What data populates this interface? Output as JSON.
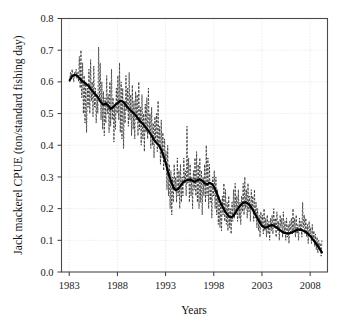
{
  "chart_data": {
    "type": "line",
    "title": "",
    "xlabel": "Years",
    "ylabel": "Jack mackerel CPUE (ton/standard fishing day)",
    "xlim": [
      1982.2,
      2009.8
    ],
    "ylim": [
      0.0,
      0.8
    ],
    "grid": true,
    "legend": "none",
    "xticks": [
      1983,
      1988,
      1993,
      1998,
      2003,
      2008
    ],
    "xtick_labels": [
      "1983",
      "1988",
      "1993",
      "1998",
      "2003",
      "2008"
    ],
    "yticks": [
      0.0,
      0.1,
      0.2,
      0.3,
      0.4,
      0.5,
      0.6,
      0.7,
      0.8
    ],
    "ytick_labels": [
      "0.0",
      "0.1",
      "0.2",
      "0.3",
      "0.4",
      "0.5",
      "0.6",
      "0.7",
      "0.8"
    ],
    "series": [
      {
        "name": "Monthly CPUE",
        "style": "dashed-thin",
        "color": "#262626",
        "x": [
          1983.05,
          1983.14,
          1983.22,
          1983.3,
          1983.39,
          1983.47,
          1983.55,
          1983.64,
          1983.72,
          1983.8,
          1983.89,
          1983.97,
          1984.05,
          1984.14,
          1984.22,
          1984.3,
          1984.39,
          1984.47,
          1984.55,
          1984.64,
          1984.72,
          1984.8,
          1984.89,
          1984.97,
          1985.05,
          1985.14,
          1985.22,
          1985.3,
          1985.39,
          1985.47,
          1985.55,
          1985.64,
          1985.72,
          1985.8,
          1985.89,
          1985.97,
          1986.05,
          1986.14,
          1986.22,
          1986.3,
          1986.39,
          1986.47,
          1986.55,
          1986.64,
          1986.72,
          1986.8,
          1986.89,
          1986.97,
          1987.05,
          1987.14,
          1987.22,
          1987.3,
          1987.39,
          1987.47,
          1987.55,
          1987.64,
          1987.72,
          1987.8,
          1987.89,
          1987.97,
          1988.05,
          1988.14,
          1988.22,
          1988.3,
          1988.39,
          1988.47,
          1988.55,
          1988.64,
          1988.72,
          1988.8,
          1988.89,
          1988.97,
          1989.05,
          1989.14,
          1989.22,
          1989.3,
          1989.39,
          1989.47,
          1989.55,
          1989.64,
          1989.72,
          1989.8,
          1989.89,
          1989.97,
          1990.05,
          1990.14,
          1990.22,
          1990.3,
          1990.39,
          1990.47,
          1990.55,
          1990.64,
          1990.72,
          1990.8,
          1990.89,
          1990.97,
          1991.05,
          1991.14,
          1991.22,
          1991.3,
          1991.39,
          1991.47,
          1991.55,
          1991.64,
          1991.72,
          1991.8,
          1991.89,
          1991.97,
          1992.05,
          1992.14,
          1992.22,
          1992.3,
          1992.39,
          1992.47,
          1992.55,
          1992.64,
          1992.72,
          1992.8,
          1992.89,
          1992.97,
          1993.05,
          1993.14,
          1993.22,
          1993.3,
          1993.39,
          1993.47,
          1993.55,
          1993.64,
          1993.72,
          1993.8,
          1993.89,
          1993.97,
          1994.05,
          1994.14,
          1994.22,
          1994.3,
          1994.39,
          1994.47,
          1994.55,
          1994.64,
          1994.72,
          1994.8,
          1994.89,
          1994.97,
          1995.05,
          1995.14,
          1995.22,
          1995.3,
          1995.39,
          1995.47,
          1995.55,
          1995.64,
          1995.72,
          1995.8,
          1995.89,
          1995.97,
          1996.05,
          1996.14,
          1996.22,
          1996.3,
          1996.39,
          1996.47,
          1996.55,
          1996.64,
          1996.72,
          1996.8,
          1996.89,
          1996.97,
          1997.05,
          1997.14,
          1997.22,
          1997.3,
          1997.39,
          1997.47,
          1997.55,
          1997.64,
          1997.72,
          1997.8,
          1997.89,
          1997.97,
          1998.05,
          1998.14,
          1998.22,
          1998.3,
          1998.39,
          1998.47,
          1998.55,
          1998.64,
          1998.72,
          1998.8,
          1998.89,
          1998.97,
          1999.05,
          1999.14,
          1999.22,
          1999.3,
          1999.39,
          1999.47,
          1999.55,
          1999.64,
          1999.72,
          1999.8,
          1999.89,
          1999.97,
          2000.05,
          2000.14,
          2000.22,
          2000.3,
          2000.39,
          2000.47,
          2000.55,
          2000.64,
          2000.72,
          2000.8,
          2000.89,
          2000.97,
          2001.05,
          2001.14,
          2001.22,
          2001.3,
          2001.39,
          2001.47,
          2001.55,
          2001.64,
          2001.72,
          2001.8,
          2001.89,
          2001.97,
          2002.05,
          2002.14,
          2002.22,
          2002.3,
          2002.39,
          2002.47,
          2002.55,
          2002.64,
          2002.72,
          2002.8,
          2002.89,
          2002.97,
          2003.05,
          2003.14,
          2003.22,
          2003.3,
          2003.39,
          2003.47,
          2003.55,
          2003.64,
          2003.72,
          2003.8,
          2003.89,
          2003.97,
          2004.05,
          2004.14,
          2004.22,
          2004.3,
          2004.39,
          2004.47,
          2004.55,
          2004.64,
          2004.72,
          2004.8,
          2004.89,
          2004.97,
          2005.05,
          2005.14,
          2005.22,
          2005.3,
          2005.39,
          2005.47,
          2005.55,
          2005.64,
          2005.72,
          2005.8,
          2005.89,
          2005.97,
          2006.05,
          2006.14,
          2006.22,
          2006.3,
          2006.39,
          2006.47,
          2006.55,
          2006.64,
          2006.72,
          2006.8,
          2006.89,
          2006.97,
          2007.05,
          2007.14,
          2007.22,
          2007.3,
          2007.39,
          2007.47,
          2007.55,
          2007.64,
          2007.72,
          2007.8,
          2007.89,
          2007.97,
          2008.05,
          2008.14,
          2008.22,
          2008.3,
          2008.39,
          2008.47,
          2008.55,
          2008.64,
          2008.72,
          2008.8,
          2008.89,
          2008.97,
          2009.05,
          2009.14,
          2009.22
        ],
        "y": [
          0.6,
          0.63,
          0.61,
          0.64,
          0.62,
          0.6,
          0.63,
          0.62,
          0.64,
          0.61,
          0.63,
          0.6,
          0.68,
          0.58,
          0.7,
          0.55,
          0.66,
          0.5,
          0.62,
          0.47,
          0.6,
          0.44,
          0.58,
          0.52,
          0.64,
          0.5,
          0.67,
          0.54,
          0.6,
          0.49,
          0.65,
          0.52,
          0.58,
          0.47,
          0.56,
          0.5,
          0.71,
          0.55,
          0.66,
          0.48,
          0.6,
          0.45,
          0.57,
          0.43,
          0.55,
          0.47,
          0.62,
          0.5,
          0.56,
          0.44,
          0.6,
          0.46,
          0.64,
          0.48,
          0.55,
          0.41,
          0.52,
          0.45,
          0.58,
          0.5,
          0.62,
          0.48,
          0.66,
          0.44,
          0.6,
          0.42,
          0.58,
          0.39,
          0.54,
          0.47,
          0.62,
          0.51,
          0.58,
          0.46,
          0.63,
          0.48,
          0.56,
          0.43,
          0.59,
          0.45,
          0.54,
          0.42,
          0.57,
          0.48,
          0.56,
          0.43,
          0.6,
          0.45,
          0.52,
          0.4,
          0.56,
          0.42,
          0.5,
          0.38,
          0.53,
          0.44,
          0.55,
          0.42,
          0.58,
          0.44,
          0.5,
          0.39,
          0.52,
          0.4,
          0.47,
          0.36,
          0.49,
          0.42,
          0.5,
          0.38,
          0.54,
          0.4,
          0.46,
          0.34,
          0.48,
          0.36,
          0.44,
          0.32,
          0.42,
          0.35,
          0.38,
          0.26,
          0.4,
          0.24,
          0.34,
          0.2,
          0.32,
          0.18,
          0.3,
          0.22,
          0.34,
          0.26,
          0.3,
          0.22,
          0.36,
          0.24,
          0.32,
          0.2,
          0.34,
          0.22,
          0.3,
          0.24,
          0.36,
          0.28,
          0.32,
          0.24,
          0.46,
          0.28,
          0.36,
          0.22,
          0.34,
          0.24,
          0.3,
          0.2,
          0.32,
          0.26,
          0.36,
          0.24,
          0.38,
          0.22,
          0.34,
          0.2,
          0.36,
          0.22,
          0.32,
          0.18,
          0.3,
          0.24,
          0.34,
          0.22,
          0.4,
          0.24,
          0.36,
          0.2,
          0.34,
          0.22,
          0.28,
          0.17,
          0.3,
          0.24,
          0.32,
          0.2,
          0.3,
          0.18,
          0.26,
          0.15,
          0.24,
          0.14,
          0.22,
          0.13,
          0.24,
          0.18,
          0.28,
          0.16,
          0.26,
          0.15,
          0.22,
          0.13,
          0.24,
          0.14,
          0.2,
          0.12,
          0.22,
          0.16,
          0.26,
          0.17,
          0.28,
          0.18,
          0.24,
          0.16,
          0.26,
          0.17,
          0.22,
          0.15,
          0.24,
          0.19,
          0.28,
          0.18,
          0.3,
          0.2,
          0.26,
          0.17,
          0.28,
          0.19,
          0.24,
          0.16,
          0.26,
          0.2,
          0.24,
          0.16,
          0.26,
          0.17,
          0.22,
          0.14,
          0.2,
          0.13,
          0.18,
          0.11,
          0.19,
          0.14,
          0.18,
          0.12,
          0.2,
          0.13,
          0.17,
          0.11,
          0.18,
          0.12,
          0.16,
          0.1,
          0.17,
          0.13,
          0.18,
          0.12,
          0.2,
          0.14,
          0.17,
          0.11,
          0.19,
          0.13,
          0.16,
          0.1,
          0.18,
          0.14,
          0.17,
          0.11,
          0.19,
          0.12,
          0.16,
          0.1,
          0.17,
          0.11,
          0.15,
          0.09,
          0.16,
          0.12,
          0.17,
          0.12,
          0.2,
          0.13,
          0.17,
          0.11,
          0.18,
          0.12,
          0.15,
          0.1,
          0.17,
          0.13,
          0.16,
          0.11,
          0.22,
          0.14,
          0.18,
          0.12,
          0.17,
          0.11,
          0.15,
          0.09,
          0.16,
          0.12,
          0.14,
          0.09,
          0.15,
          0.1,
          0.13,
          0.08,
          0.12,
          0.07,
          0.11,
          0.06,
          0.1,
          0.08,
          0.09,
          0.05,
          0.1
        ]
      },
      {
        "name": "Smoothed CPUE (moving average)",
        "style": "solid-bold",
        "color": "#000000",
        "x": [
          1983.05,
          1983.3,
          1983.55,
          1983.8,
          1984.05,
          1984.3,
          1984.55,
          1984.8,
          1985.05,
          1985.3,
          1985.55,
          1985.8,
          1986.05,
          1986.3,
          1986.55,
          1986.8,
          1987.05,
          1987.3,
          1987.55,
          1987.8,
          1988.05,
          1988.3,
          1988.55,
          1988.8,
          1989.05,
          1989.3,
          1989.55,
          1989.8,
          1990.05,
          1990.3,
          1990.55,
          1990.8,
          1991.05,
          1991.3,
          1991.55,
          1991.8,
          1992.05,
          1992.3,
          1992.55,
          1992.8,
          1993.05,
          1993.3,
          1993.55,
          1993.8,
          1994.05,
          1994.3,
          1994.55,
          1994.8,
          1995.05,
          1995.3,
          1995.55,
          1995.8,
          1996.05,
          1996.3,
          1996.55,
          1996.8,
          1997.05,
          1997.3,
          1997.55,
          1997.8,
          1998.05,
          1998.3,
          1998.55,
          1998.8,
          1999.05,
          1999.3,
          1999.55,
          1999.8,
          2000.05,
          2000.3,
          2000.55,
          2000.8,
          2001.05,
          2001.3,
          2001.55,
          2001.8,
          2002.05,
          2002.3,
          2002.55,
          2002.8,
          2003.05,
          2003.3,
          2003.55,
          2003.8,
          2004.05,
          2004.3,
          2004.55,
          2004.8,
          2005.05,
          2005.3,
          2005.55,
          2005.8,
          2006.05,
          2006.3,
          2006.55,
          2006.8,
          2007.05,
          2007.3,
          2007.55,
          2007.8,
          2008.05,
          2008.3,
          2008.55,
          2008.8,
          2009.05,
          2009.22
        ],
        "y": [
          0.605,
          0.618,
          0.622,
          0.62,
          0.612,
          0.603,
          0.598,
          0.592,
          0.586,
          0.575,
          0.566,
          0.558,
          0.548,
          0.535,
          0.528,
          0.532,
          0.525,
          0.515,
          0.52,
          0.528,
          0.534,
          0.54,
          0.538,
          0.53,
          0.52,
          0.512,
          0.505,
          0.498,
          0.488,
          0.478,
          0.47,
          0.462,
          0.452,
          0.442,
          0.43,
          0.418,
          0.408,
          0.4,
          0.386,
          0.366,
          0.34,
          0.31,
          0.288,
          0.268,
          0.258,
          0.262,
          0.272,
          0.282,
          0.288,
          0.29,
          0.292,
          0.288,
          0.285,
          0.29,
          0.292,
          0.288,
          0.28,
          0.276,
          0.282,
          0.278,
          0.268,
          0.25,
          0.23,
          0.212,
          0.198,
          0.186,
          0.176,
          0.172,
          0.178,
          0.19,
          0.202,
          0.212,
          0.218,
          0.22,
          0.216,
          0.208,
          0.196,
          0.182,
          0.168,
          0.155,
          0.145,
          0.14,
          0.142,
          0.146,
          0.148,
          0.145,
          0.14,
          0.134,
          0.128,
          0.124,
          0.122,
          0.122,
          0.124,
          0.128,
          0.132,
          0.134,
          0.133,
          0.13,
          0.126,
          0.12,
          0.112,
          0.102,
          0.092,
          0.082,
          0.07,
          0.062
        ]
      }
    ]
  }
}
